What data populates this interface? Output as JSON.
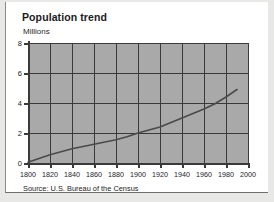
{
  "card": {
    "title": "Population trend",
    "source": "Source: U.S. Bureau of the Census"
  },
  "chart_data": {
    "type": "line",
    "title": "Population trend",
    "subtitle": "",
    "xlabel": "",
    "ylabel": "Millions",
    "xlim": [
      1800,
      2000
    ],
    "ylim": [
      0,
      8
    ],
    "x_ticks": [
      1800,
      1820,
      1840,
      1860,
      1880,
      1900,
      1920,
      1940,
      1960,
      1980,
      2000
    ],
    "y_ticks": [
      0,
      2,
      4,
      6,
      8
    ],
    "grid": true,
    "legend": "none",
    "line_color": "#4a4a4a",
    "plot_background": "#a9a9a9",
    "series": [
      {
        "name": "Population",
        "x": [
          1800,
          1810,
          1820,
          1830,
          1840,
          1850,
          1860,
          1870,
          1880,
          1890,
          1900,
          1910,
          1920,
          1930,
          1940,
          1950,
          1960,
          1970,
          1980,
          1990
        ],
        "values": [
          0.05,
          0.3,
          0.55,
          0.75,
          0.95,
          1.1,
          1.25,
          1.4,
          1.55,
          1.75,
          2.0,
          2.2,
          2.4,
          2.7,
          3.0,
          3.3,
          3.6,
          3.95,
          4.4,
          4.9
        ]
      }
    ],
    "annotations": [
      "Source: U.S. Bureau of the Census"
    ]
  }
}
